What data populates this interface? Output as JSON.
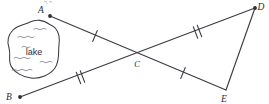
{
  "figure": {
    "kind": "geometry-diagram",
    "background_color": "#ffffff",
    "line_color": "#3b3b44",
    "label_color": "#2e2e36",
    "points": [
      {
        "id": "A",
        "label": "A",
        "x": 50,
        "y": 16,
        "label_x": 41,
        "label_y": 12
      },
      {
        "id": "B",
        "label": "B",
        "x": 20,
        "y": 97,
        "label_x": 9,
        "label_y": 99
      },
      {
        "id": "C",
        "label": "C",
        "x": 140,
        "y": 56,
        "label_x": 136,
        "label_y": 66
      },
      {
        "id": "D",
        "label": "D",
        "x": 255,
        "y": 8,
        "label_x": 259,
        "label_y": 9
      },
      {
        "id": "E",
        "label": "E",
        "x": 226,
        "y": 90,
        "label_x": 223,
        "label_y": 102
      }
    ],
    "segments": [
      {
        "id": "AC",
        "from": "A",
        "to": "C",
        "ticks": 1
      },
      {
        "id": "CE",
        "from": "C",
        "to": "E",
        "ticks": 1
      },
      {
        "id": "BC",
        "from": "B",
        "to": "C",
        "ticks": 2
      },
      {
        "id": "CD",
        "from": "C",
        "to": "D",
        "ticks": 2
      },
      {
        "id": "DE",
        "from": "D",
        "to": "E",
        "ticks": 0
      }
    ],
    "lake": {
      "label": "lake",
      "label_x": 34,
      "label_y": 55,
      "outline_color": "#3b3b44",
      "fill_color": "#ffffff"
    }
  }
}
